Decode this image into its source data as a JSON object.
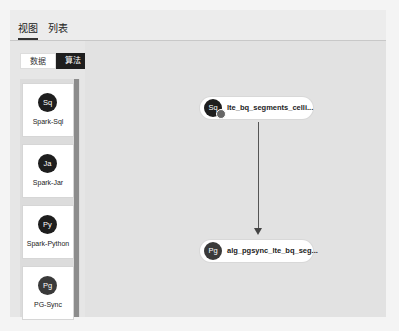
{
  "tabs": [
    {
      "label": "视图",
      "active": true
    },
    {
      "label": "列表",
      "active": false
    }
  ],
  "segment": [
    {
      "label": "数据",
      "active": false
    },
    {
      "label": "算法",
      "active": true
    }
  ],
  "palette": [
    {
      "icon": "Sq",
      "label": "Spark-Sql"
    },
    {
      "icon": "Ja",
      "label": "Spark-Jar"
    },
    {
      "icon": "Py",
      "label": "Spark-Python"
    },
    {
      "icon": "Pg",
      "label": "PG-Sync"
    }
  ],
  "nodes": [
    {
      "icon": "Sq",
      "label": "lte_bq_segments_celli...",
      "icon_color": "#1e1e1e"
    },
    {
      "icon": "Pg",
      "label": "alg_pgsync_lte_bq_seg...",
      "icon_color": "#3a3a3a"
    }
  ],
  "colors": {
    "accent": "#1e1e1e",
    "canvas": "#e2e2e2"
  }
}
